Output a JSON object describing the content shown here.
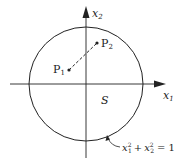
{
  "diagram": {
    "axes": {
      "x_label": "x",
      "x_sub": "1",
      "y_label": "x",
      "y_sub": "2"
    },
    "points": [
      {
        "name": "P",
        "sub": "1"
      },
      {
        "name": "P",
        "sub": "2"
      }
    ],
    "region_label": "S",
    "equation": {
      "a": "x",
      "a_sub": "1",
      "a_sup": "2",
      "plus": "+",
      "b": "x",
      "b_sub": "2",
      "b_sup": "2",
      "rhs": "= 1"
    },
    "colors": {
      "stroke": "#222222",
      "background": "#ffffff"
    }
  }
}
